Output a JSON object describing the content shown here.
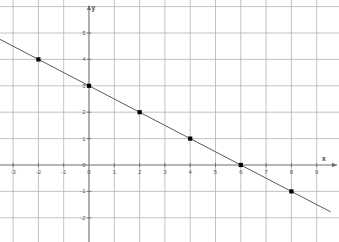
{
  "chart_data": {
    "type": "line",
    "title": "",
    "subtitle": "",
    "xlabel": "x",
    "ylabel": "y",
    "xlim": [
      -3.6,
      9.9
    ],
    "ylim": [
      -2.8,
      5.9
    ],
    "grid": true,
    "legend": "none",
    "equation": "y = -0.5x + 3",
    "slope": -0.5,
    "intercept": 3,
    "line": {
      "x": [
        -3.55,
        9.55
      ],
      "y": [
        4.775,
        -1.775
      ]
    },
    "x_ticks": [
      -3,
      -2,
      -1,
      0,
      1,
      2,
      3,
      4,
      5,
      6,
      7,
      8,
      9
    ],
    "x_tick_labels": [
      "-3",
      "-2",
      "-1",
      "0",
      "1",
      "2",
      "3",
      "4",
      "5",
      "6",
      "7",
      "8",
      "9"
    ],
    "y_ticks": [
      -2,
      -1,
      0,
      1,
      2,
      3,
      4,
      5
    ],
    "y_tick_labels": [
      "-2",
      "-1",
      "0",
      "1",
      "2",
      "3",
      "4",
      "5"
    ],
    "points": [
      {
        "x": -2,
        "y": 4,
        "label": "(-2, 4)"
      },
      {
        "x": 0,
        "y": 3,
        "label": "(0, 3)"
      },
      {
        "x": 2,
        "y": 2,
        "label": "(2, 2)"
      },
      {
        "x": 4,
        "y": 1,
        "label": "(4, 1)"
      },
      {
        "x": 6,
        "y": 0,
        "label": "(6, 0)"
      },
      {
        "x": 8,
        "y": -1,
        "label": "(8, -1)"
      }
    ],
    "colors": {
      "background": "#ffffff",
      "grid": "#b4b4b4",
      "axis": "#6e6e6e",
      "line": "#5a5a5a",
      "point": "#000000",
      "tick_text": "#5a5a5a"
    }
  },
  "axes": {
    "x_axis_name": "x",
    "y_axis_name": "y"
  }
}
